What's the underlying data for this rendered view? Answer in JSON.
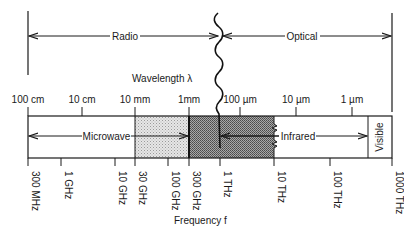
{
  "regions": {
    "radio": "Radio",
    "optical": "Optical",
    "microwave": "Microwave",
    "infrared": "Infrared",
    "visible": "Visible"
  },
  "axes": {
    "wavelength_label": "Wavelength λ",
    "frequency_label": "Frequency f",
    "wavelength_ticks": [
      {
        "label": "100 cm",
        "x": 28
      },
      {
        "label": "10 cm",
        "x": 82
      },
      {
        "label": "10 mm",
        "x": 135
      },
      {
        "label": "1mm",
        "x": 189
      },
      {
        "label": "100 µm",
        "x": 240
      },
      {
        "label": "10 µm",
        "x": 296
      },
      {
        "label": "1 µm",
        "x": 352
      }
    ],
    "frequency_ticks": [
      {
        "label": "300 MHz",
        "x": 28
      },
      {
        "label": "1 GHz",
        "x": 61
      },
      {
        "label": "10 GHz",
        "x": 115
      },
      {
        "label": "30 GHz",
        "x": 135
      },
      {
        "label": "100 GHz",
        "x": 168
      },
      {
        "label": "300 GHz",
        "x": 189
      },
      {
        "label": "1 THz",
        "x": 220
      },
      {
        "label": "10 THz",
        "x": 274
      },
      {
        "label": "100 THz",
        "x": 330
      },
      {
        "label": "1000 THz",
        "x": 392
      }
    ]
  },
  "colors": {
    "line": "#1a1a1a",
    "light_shade": "#d4d4d4",
    "dark_shade": "#8c8c8c"
  }
}
